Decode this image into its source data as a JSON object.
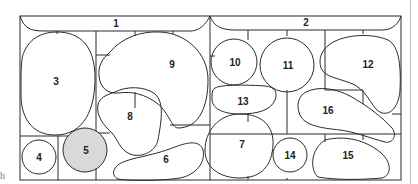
{
  "diagram": {
    "type": "numbered-region-layout",
    "stroke_color": "#2a2a2a",
    "highlight_color": "#d9d9d9",
    "side_label": "h",
    "regions": [
      {
        "id": "1",
        "label": "1",
        "shape": "top-banner-left",
        "highlighted": false
      },
      {
        "id": "2",
        "label": "2",
        "shape": "top-banner-right",
        "highlighted": false
      },
      {
        "id": "3",
        "label": "3",
        "shape": "large-oval",
        "highlighted": false
      },
      {
        "id": "4",
        "label": "4",
        "shape": "circle",
        "highlighted": false
      },
      {
        "id": "5",
        "label": "5",
        "shape": "circle",
        "highlighted": true
      },
      {
        "id": "6",
        "label": "6",
        "shape": "elongated-blob",
        "highlighted": false
      },
      {
        "id": "7",
        "label": "7",
        "shape": "oval",
        "highlighted": false
      },
      {
        "id": "8",
        "label": "8",
        "shape": "blob",
        "highlighted": false
      },
      {
        "id": "9",
        "label": "9",
        "shape": "kidney",
        "highlighted": false
      },
      {
        "id": "10",
        "label": "10",
        "shape": "circle",
        "highlighted": false
      },
      {
        "id": "11",
        "label": "11",
        "shape": "circle",
        "highlighted": false
      },
      {
        "id": "12",
        "label": "12",
        "shape": "kidney",
        "highlighted": false
      },
      {
        "id": "13",
        "label": "13",
        "shape": "pill",
        "highlighted": false
      },
      {
        "id": "14",
        "label": "14",
        "shape": "circle",
        "highlighted": false
      },
      {
        "id": "15",
        "label": "15",
        "shape": "teardrop",
        "highlighted": false
      },
      {
        "id": "16",
        "label": "16",
        "shape": "elongated-blob",
        "highlighted": false
      }
    ]
  }
}
